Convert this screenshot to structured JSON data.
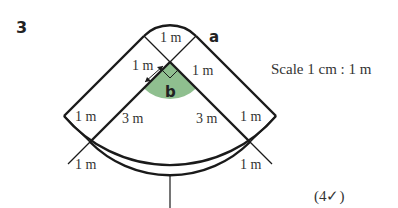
{
  "question": {
    "number": "3",
    "marks": "(4✓)"
  },
  "scale_text": "Scale 1 cm : 1 m",
  "diagram": {
    "region_labels": {
      "a": "a",
      "b": "b"
    },
    "dimension_labels": {
      "top_cap": "1 m",
      "arrow_width": "1 m",
      "right_inner_top": "1 m",
      "left_upper": "1 m",
      "left_lower": "1 m",
      "right_upper": "1 m",
      "right_lower": "1 m",
      "left_radius": "3 m",
      "right_radius": "3 m"
    },
    "colors": {
      "shaded_sector": "#8fbf8f",
      "line": "#1a1a1a"
    }
  }
}
